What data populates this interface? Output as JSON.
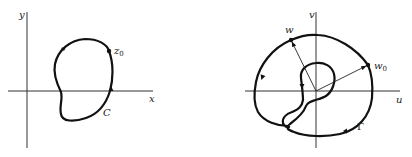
{
  "left_diagram": {
    "x_axis_label": "x",
    "y_axis_label": "y",
    "point_label": "z",
    "point_subscript": "0",
    "curve_label": "C"
  },
  "right_diagram": {
    "x_axis_label": "u",
    "y_axis_label": "v",
    "point_w_label": "w",
    "point_w0_label": "w",
    "point_w0_subscript": "0",
    "curve_label": "Γ"
  },
  "colors": {
    "ink": "#111111",
    "background": "#ffffff"
  }
}
